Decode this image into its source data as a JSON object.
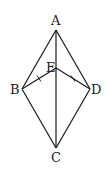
{
  "diagram": {
    "type": "geometry",
    "points": {
      "A": {
        "label": "A",
        "x": 56,
        "y": 30
      },
      "E": {
        "label": "E",
        "x": 56,
        "y": 68
      },
      "B": {
        "label": "B",
        "x": 22,
        "y": 89
      },
      "D": {
        "label": "D",
        "x": 90,
        "y": 89
      },
      "C": {
        "label": "C",
        "x": 56,
        "y": 148
      }
    },
    "segments": [
      "AB",
      "AD",
      "AC",
      "BE",
      "ED",
      "BC",
      "DC"
    ],
    "equal_marks": [
      "BE",
      "ED"
    ],
    "colors": {
      "stroke": "#1a1a1a",
      "background": "#ffffff"
    }
  }
}
